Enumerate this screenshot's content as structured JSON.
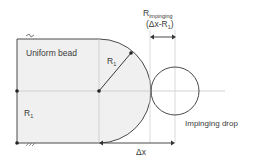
{
  "labels": {
    "bead": "Uniform bead",
    "radius_arc": "R",
    "radius_arc_sub": "1",
    "radius_vertical": "R",
    "radius_vertical_sub": "1",
    "impinging_r": "R",
    "impinging_r_sub": "impinging",
    "impinging_expr": "(Δx-R",
    "impinging_expr_sub": "1",
    "impinging_expr_close": ")",
    "drop": "Impinging drop",
    "dx": "Δx"
  },
  "colors": {
    "bead_fill": "#f0f0f0",
    "line": "#4a4a4a",
    "guide": "#c8c8c8",
    "text": "#3a3a3a"
  }
}
